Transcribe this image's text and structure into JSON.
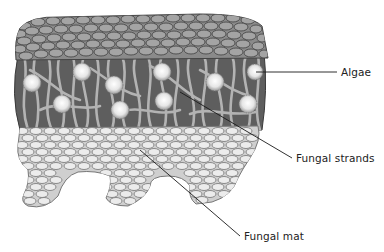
{
  "diagram": {
    "layers": [
      {
        "name": "upper-cortex",
        "fill": "#9a9a9a",
        "outline": "#4a4a4a"
      },
      {
        "name": "algal-layer",
        "fill": "#5e5e5e",
        "strand_color": "#a8a8a8"
      },
      {
        "name": "fungal-mat",
        "fill": "#e4e4e4",
        "outline": "#7a7a7a"
      }
    ],
    "labels": [
      {
        "id": "algae",
        "text": "Algae",
        "x": 341,
        "y": 66,
        "line": [
          256,
          72,
          337,
          72
        ]
      },
      {
        "id": "fungal-strands",
        "text": "Fungal strands",
        "x": 296,
        "y": 152,
        "line": [
          180,
          92,
          292,
          158
        ]
      },
      {
        "id": "fungal-mat",
        "text": "Fungal mat",
        "x": 244,
        "y": 230,
        "line": [
          140,
          150,
          240,
          236
        ]
      }
    ],
    "leader_color": "#1a1a1a"
  }
}
